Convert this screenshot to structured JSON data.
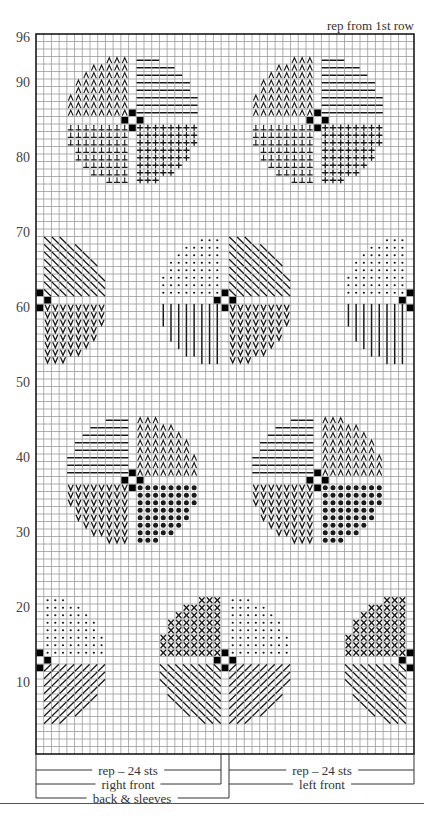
{
  "chart": {
    "header_note": "rep from 1st row",
    "grid": {
      "columns": 49,
      "rows": 96,
      "left": 36,
      "bottom": 754,
      "cell_width": 7.714,
      "cell_height": 7.5,
      "line_color": "#9a9a9a",
      "border_color": "#1a1a1a",
      "symbol_color": "#1a1a1a"
    },
    "row_labels": [
      {
        "row": 96,
        "text": "96"
      },
      {
        "row": 90,
        "text": "90"
      },
      {
        "row": 80,
        "text": "80"
      },
      {
        "row": 70,
        "text": "70"
      },
      {
        "row": 60,
        "text": "60"
      },
      {
        "row": 50,
        "text": "50"
      },
      {
        "row": 40,
        "text": "40"
      },
      {
        "row": 30,
        "text": "30"
      },
      {
        "row": 20,
        "text": "20"
      },
      {
        "row": 10,
        "text": "10"
      }
    ],
    "motif_radius_sq": 76,
    "motif_bands": [
      {
        "name": "band-a",
        "center_row": 85,
        "center_cols": [
          12,
          36
        ],
        "quadrants": {
          "upper_left": "caret",
          "upper_right": "dash",
          "lower_left": "inverted-t",
          "lower_right": "plus"
        }
      },
      {
        "name": "band-b",
        "center_row": 61,
        "center_cols": [
          0,
          24,
          48
        ],
        "quadrants": {
          "upper_left": "small-dot",
          "upper_right": "backslash",
          "lower_left": "vbar",
          "lower_right": "vee"
        }
      },
      {
        "name": "band-c",
        "center_row": 37,
        "center_cols": [
          12,
          36
        ],
        "quadrants": {
          "upper_left": "dash",
          "upper_right": "caret",
          "lower_left": "vee",
          "lower_right": "big-dot"
        }
      },
      {
        "name": "band-d",
        "center_row": 13,
        "center_cols": [
          0,
          24,
          48
        ],
        "quadrants": {
          "upper_left": "cross",
          "upper_right": "small-dot",
          "lower_left": "backslash",
          "lower_right": "slash"
        }
      }
    ],
    "brackets": [
      {
        "label": "rep – 24 sts",
        "from_x": 36,
        "to_x": 221,
        "y": 770,
        "label_x": 128
      },
      {
        "label": "right front",
        "from_x": 36,
        "to_x": 221,
        "y": 784,
        "label_x": 128
      },
      {
        "label": "back & sleeves",
        "from_x": 36,
        "to_x": 229,
        "y": 798,
        "label_x": 132
      },
      {
        "label": "rep – 24 sts",
        "from_x": 229,
        "to_x": 414,
        "y": 770,
        "label_x": 322
      },
      {
        "label": "left front",
        "from_x": 229,
        "to_x": 414,
        "y": 784,
        "label_x": 322
      }
    ]
  },
  "chart_data": {
    "type": "table",
    "annotations": [
      "rep from 1st row"
    ],
    "ylabel": "Row number",
    "y_ticks": [
      96,
      90,
      80,
      70,
      60,
      50,
      40,
      30,
      20,
      10
    ],
    "rows": 96,
    "stitches_shown": 49,
    "repeat": "24 sts",
    "sections": [
      "rep – 24 sts",
      "right front",
      "back & sleeves",
      "rep – 24 sts",
      "left front"
    ],
    "motifs": [
      {
        "center_row": 85,
        "center_stitches": [
          13,
          37
        ],
        "symbols": [
          "caret",
          "dash",
          "inverted-t",
          "plus"
        ]
      },
      {
        "center_row": 61,
        "center_stitches": [
          1,
          25,
          49
        ],
        "symbols": [
          "small-dot",
          "backslash",
          "vertical-bar",
          "vee"
        ]
      },
      {
        "center_row": 37,
        "center_stitches": [
          13,
          37
        ],
        "symbols": [
          "dash",
          "caret",
          "vee",
          "big-dot"
        ]
      },
      {
        "center_row": 13,
        "center_stitches": [
          1,
          25,
          49
        ],
        "symbols": [
          "cross",
          "small-dot",
          "backslash",
          "slash"
        ]
      }
    ]
  }
}
